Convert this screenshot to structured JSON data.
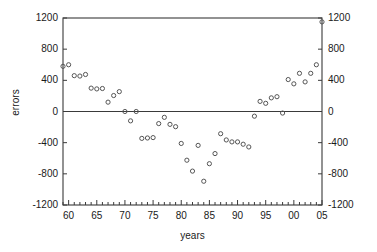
{
  "chart_data": {
    "type": "scatter",
    "title": "",
    "xlabel": "years",
    "ylabel": "errors",
    "xlim": [
      59,
      105
    ],
    "ylim": [
      -1200,
      1200
    ],
    "grid": false,
    "legend": null,
    "y_ticks": [
      1200,
      800,
      400,
      0,
      -400,
      -800,
      -1200
    ],
    "y_tick_labels_left": [
      "1200",
      "800",
      "400",
      "0",
      "-400",
      "-800",
      "-1200"
    ],
    "y_tick_labels_right": [
      "1200",
      "800",
      "400",
      "0",
      "-400",
      "-800",
      "-1200"
    ],
    "x_ticks": [
      60,
      65,
      70,
      75,
      80,
      85,
      90,
      95,
      100,
      105
    ],
    "x_tick_labels": [
      "60",
      "65",
      "70",
      "75",
      "80",
      "85",
      "90",
      "95",
      "00",
      "05"
    ],
    "x_minor_tick_step": 1,
    "zero_line": 0,
    "marker": "open-circle",
    "marker_color": "#555555",
    "series": [
      {
        "name": "errors",
        "x": [
          59,
          60,
          61,
          62,
          63,
          64,
          65,
          66,
          67,
          68,
          69,
          70,
          71,
          72,
          73,
          74,
          75,
          76,
          77,
          78,
          79,
          80,
          81,
          82,
          83,
          84,
          85,
          86,
          87,
          88,
          89,
          90,
          91,
          92,
          93,
          94,
          95,
          96,
          97,
          98,
          99,
          100,
          101,
          102,
          103,
          104,
          105
        ],
        "y": [
          580,
          600,
          460,
          455,
          475,
          300,
          290,
          295,
          120,
          205,
          255,
          0,
          -120,
          0,
          -345,
          -340,
          -335,
          -155,
          -75,
          -165,
          -195,
          -410,
          -625,
          -765,
          -435,
          -895,
          -670,
          -540,
          -285,
          -365,
          -390,
          -390,
          -420,
          -455,
          -60,
          130,
          105,
          175,
          190,
          -20,
          410,
          355,
          490,
          380,
          490,
          600,
          1150
        ]
      }
    ]
  },
  "axes": {
    "y_label": "errors",
    "x_label": "years"
  }
}
